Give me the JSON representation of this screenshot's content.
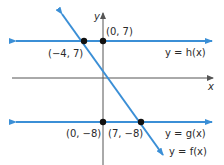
{
  "colors": {
    "line": "#3b8fd6",
    "axis": "#555555",
    "point": "#111111",
    "text": "#2a2a2a"
  },
  "axes": {
    "x_label": "x",
    "y_label": "y"
  },
  "lines": [
    {
      "id": "h",
      "label": "y = h(x)",
      "type": "horizontal",
      "y": 7
    },
    {
      "id": "g",
      "label": "y = g(x)",
      "type": "horizontal",
      "y": -8
    },
    {
      "id": "f",
      "label": "y = f(x)",
      "type": "linear",
      "through": [
        [
          -4,
          7
        ],
        [
          7,
          -8
        ]
      ]
    }
  ],
  "points": [
    {
      "x": -4,
      "y": 7,
      "label": "(−4, 7)"
    },
    {
      "x": 0,
      "y": 7,
      "label": "(0, 7)"
    },
    {
      "x": 0,
      "y": -8,
      "label": "(0, −8)"
    },
    {
      "x": 7,
      "y": -8,
      "label": "(7, −8)"
    }
  ]
}
